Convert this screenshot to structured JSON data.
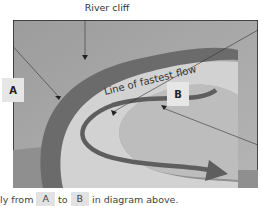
{
  "labels": {
    "river_cliff": "River cliff",
    "fastest_flow": "Line of fastest flow",
    "box_a": "A",
    "box_b": "B"
  },
  "caption": {
    "prefix": "ly from",
    "from": "A",
    "to_word": "to",
    "to": "B",
    "suffix": "in diagram above."
  },
  "colors": {
    "background_land": "#a9a9a9",
    "river_cliff_band": "#6b6b6b",
    "river_water": "#cfcfcf",
    "flow_arrow": "#5e5e5e",
    "label_box": "#e6e6e6"
  }
}
